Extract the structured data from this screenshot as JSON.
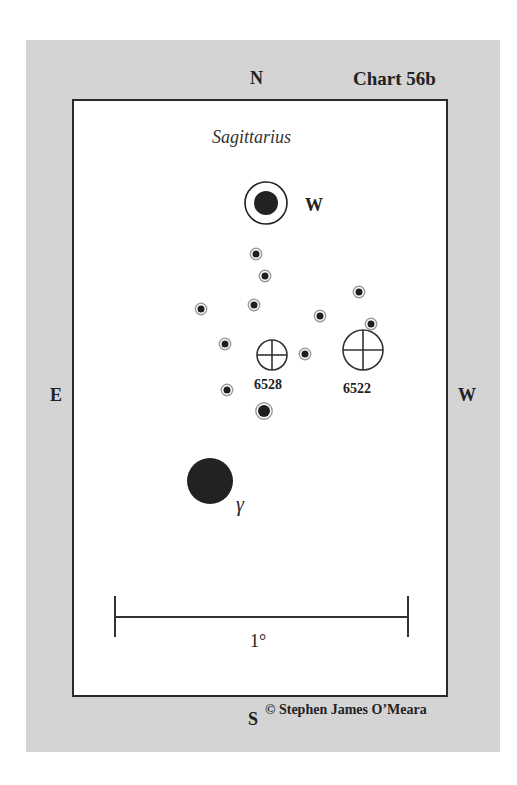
{
  "chart": {
    "title": "Chart 56b",
    "constellation": "Sagittarius",
    "compass": {
      "north": "N",
      "south": "S",
      "east": "E",
      "west": "W"
    },
    "scale_bar_label": "1°",
    "credit": "© Stephen James O’Meara",
    "colors": {
      "panel": "#d4d4d4",
      "chart_bg": "#ffffff",
      "ink": "#222222",
      "star_halo": "#9a9a9a"
    }
  },
  "objects": {
    "labeled_star_w": {
      "label": "W",
      "x": 266,
      "y": 203,
      "core_r": 12,
      "ring_r": 21
    },
    "gamma_star": {
      "label": "γ",
      "x": 210,
      "y": 481,
      "r": 23
    },
    "clusters": [
      {
        "label": "6528",
        "x": 272,
        "y": 355,
        "r": 15
      },
      {
        "label": "6522",
        "x": 363,
        "y": 350,
        "r": 20
      }
    ],
    "field_stars": [
      {
        "x": 256,
        "y": 254,
        "r": 3.5
      },
      {
        "x": 265,
        "y": 276,
        "r": 3.5
      },
      {
        "x": 359,
        "y": 292,
        "r": 3.5
      },
      {
        "x": 201,
        "y": 309,
        "r": 3.5
      },
      {
        "x": 254,
        "y": 305,
        "r": 3.5
      },
      {
        "x": 320,
        "y": 316,
        "r": 3.5
      },
      {
        "x": 371,
        "y": 324,
        "r": 3.5
      },
      {
        "x": 225,
        "y": 344,
        "r": 3.5
      },
      {
        "x": 305,
        "y": 354,
        "r": 3.5
      },
      {
        "x": 227,
        "y": 390,
        "r": 3.5
      },
      {
        "x": 264,
        "y": 411,
        "r": 6
      }
    ]
  }
}
